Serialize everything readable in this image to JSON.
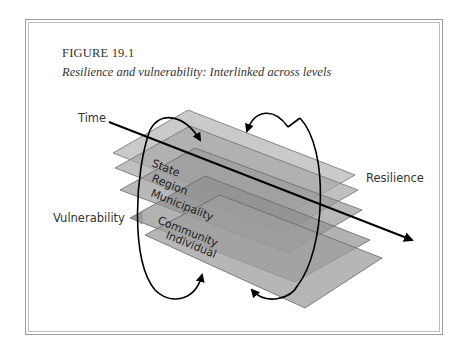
{
  "figure": {
    "number": "FIGURE 19.1",
    "title": "Resilience and vulnerability: Interlinked across levels"
  },
  "diagram": {
    "axis_label_time": "Time",
    "label_resilience": "Resilience",
    "label_vulnerability": "Vulnerability",
    "levels": [
      "State",
      "Region",
      "Municipality",
      "Community",
      "Individual"
    ],
    "colors": {
      "plane_fill": "#9c9c9c",
      "plane_stroke": "#6e6e6e",
      "line": "#000000",
      "text": "#333333"
    }
  }
}
